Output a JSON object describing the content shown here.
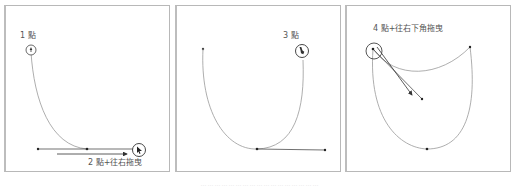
{
  "figure": {
    "panels": [
      {
        "id": "panel-1",
        "steps": [
          {
            "label": "1 點",
            "action": "click"
          },
          {
            "label": "2 點+往右拖曳",
            "action": "click-and-drag-right"
          }
        ]
      },
      {
        "id": "panel-2",
        "steps": [
          {
            "label": "3 點",
            "action": "click"
          }
        ]
      },
      {
        "id": "panel-3",
        "steps": [
          {
            "label": "4 點+往右下角拖曳",
            "action": "click-and-drag-down-right"
          }
        ]
      }
    ],
    "caption": "……………………………………………",
    "colors": {
      "border": "#b8b8b8",
      "curve": "#888888",
      "handle": "#333333",
      "text": "#555555"
    }
  }
}
